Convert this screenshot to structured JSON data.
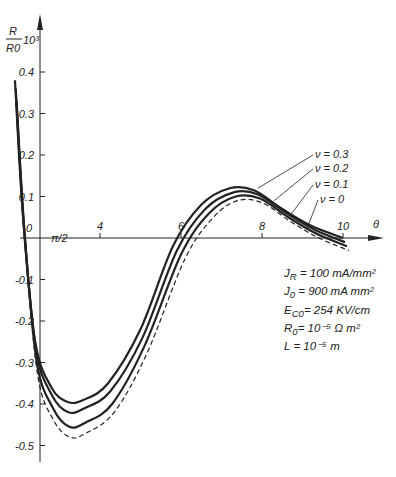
{
  "chart_data": {
    "type": "line",
    "title": "",
    "xlabel": "θ",
    "ylabel": "R/R₀ 10³",
    "ylabel_num": "R",
    "ylabel_den": "R0",
    "ylabel_suffix": "10³",
    "origin_label": "0",
    "axis_break_label": "π/2",
    "xticks": [
      4,
      6,
      8,
      10
    ],
    "yticks": [
      0.4,
      0.3,
      0.2,
      0.1,
      -0.1,
      -0.2,
      -0.3,
      -0.4,
      -0.5
    ],
    "ytick_labels": [
      "0.4",
      "0.3",
      "0.2",
      "0.1",
      "-0.1",
      "-0.2",
      "-0.3",
      "-0.4",
      "-0.5"
    ],
    "xlim": [
      1.5,
      10.5
    ],
    "ylim": [
      -0.53,
      0.45
    ],
    "grid": false,
    "legend_position": "inline labels, upper right",
    "series": [
      {
        "name": "ν = 0.3",
        "style": "solid",
        "x": [
          1.9,
          2.1,
          2.4,
          2.8,
          3.2,
          3.6,
          4.2,
          5.0,
          5.8,
          6.5,
          7.2,
          7.8,
          8.5,
          9.2,
          10.0
        ],
        "y": [
          0.38,
          0.05,
          -0.25,
          -0.36,
          -0.395,
          -0.39,
          -0.35,
          -0.22,
          -0.02,
          0.08,
          0.12,
          0.115,
          0.07,
          0.03,
          0.0
        ]
      },
      {
        "name": "ν = 0.2",
        "style": "solid",
        "x": [
          1.92,
          2.12,
          2.42,
          2.82,
          3.22,
          3.62,
          4.25,
          5.05,
          5.9,
          6.6,
          7.3,
          7.9,
          8.6,
          9.3,
          10.05
        ],
        "y": [
          0.36,
          0.03,
          -0.27,
          -0.38,
          -0.42,
          -0.41,
          -0.37,
          -0.24,
          -0.03,
          0.07,
          0.11,
          0.105,
          0.06,
          0.02,
          -0.01
        ]
      },
      {
        "name": "ν = 0.1",
        "style": "solid",
        "x": [
          1.94,
          2.14,
          2.44,
          2.84,
          3.24,
          3.64,
          4.3,
          5.1,
          6.0,
          6.7,
          7.35,
          7.95,
          8.65,
          9.35,
          10.1
        ],
        "y": [
          0.33,
          0.01,
          -0.3,
          -0.41,
          -0.455,
          -0.445,
          -0.4,
          -0.26,
          -0.04,
          0.06,
          0.1,
          0.095,
          0.05,
          0.01,
          -0.02
        ]
      },
      {
        "name": "ν = 0",
        "style": "dashed",
        "x": [
          1.96,
          2.16,
          2.46,
          2.86,
          3.26,
          3.66,
          4.35,
          5.15,
          6.1,
          6.8,
          7.4,
          8.0,
          8.7,
          9.4,
          10.15
        ],
        "y": [
          0.28,
          -0.02,
          -0.33,
          -0.44,
          -0.48,
          -0.47,
          -0.42,
          -0.28,
          -0.05,
          0.05,
          0.09,
          0.085,
          0.04,
          0.0,
          -0.03
        ]
      }
    ],
    "annotations": [
      "J_R = 100 mA/mm²",
      "J_0 = 900 mA mm²",
      "E_C0 = 254 KV/cm",
      "R_0 = 10⁻⁵ Ω m²",
      "L = 10⁻⁵ m"
    ]
  },
  "params": {
    "jr_sym": "J",
    "jr_sub": "R",
    "jr_val": "= 100 mA/mm²",
    "j0_sym": "J",
    "j0_sub": "0",
    "j0_val": "= 900 mA mm²",
    "ec_sym": "E",
    "ec_sub": "C0",
    "ec_val": "= 254 KV/cm",
    "r0_sym": "R",
    "r0_sub": "0",
    "r0_val": "= 10⁻⁵ Ω m²",
    "l_sym": "L",
    "l_val": " = 10⁻⁵ m"
  }
}
